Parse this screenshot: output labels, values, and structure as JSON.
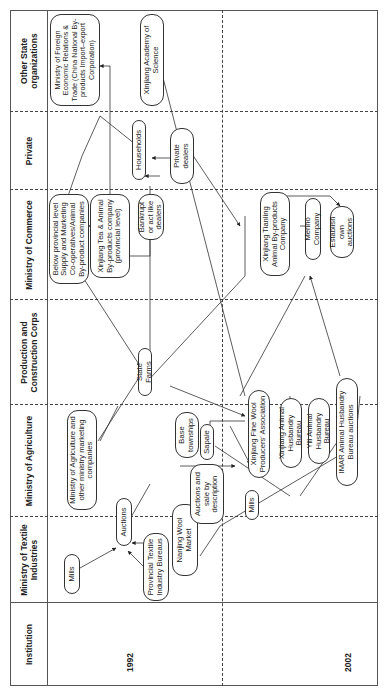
{
  "columns": [
    {
      "id": "institution",
      "label": "Institution"
    },
    {
      "id": "textile",
      "label": "Ministry of Textile Industries"
    },
    {
      "id": "agriculture",
      "label": "Ministry of Agriculture"
    },
    {
      "id": "pcc",
      "label": "Production and Construction Corps"
    },
    {
      "id": "commerce",
      "label": "Ministry of Commerce"
    },
    {
      "id": "private",
      "label": "Private"
    },
    {
      "id": "other",
      "label": "Other State organizations"
    }
  ],
  "years": {
    "y1992": "1992",
    "y2002": "2002"
  },
  "nodes": {
    "mills_1992": "Mills",
    "provincial_textile": "Provincial Textile Industry Bureaus",
    "auctions_1992": "Auctions",
    "nanjing_wool": "Nanjing Wool Market",
    "moa_marketing": "Ministry of Agriculture and other ministry marketing companies",
    "state_farms": "State Farms",
    "below_provincial": "Below provincial level Supply and Marketing Co-operatives/Animal By-product companies",
    "xinjiang_tea": "Xinjiang Tea & Animal By-products company (provincial level)",
    "bankrupt": "Bankrupt or act like dealers",
    "households": "Households",
    "private_dealers": "Private dealers",
    "mofert": "Ministry of Foreign Economic Relations & Trade (China National By-products Import–export Corporation)",
    "xj_academy": "Xinjiang Academy of Science",
    "base_townships": "Base townships",
    "sapale": "Sapale",
    "auctions_sale_desc": "Auctions and sale by description",
    "mills_2002": "Mills",
    "xj_fine_wool": "Xinjiang Fine Wool Producers' Association",
    "xj_animal_husbandry": "Xinjiang Animal Husbandry Bureau",
    "yili_bureau": "Yili Animal Husbandry Bureau",
    "imar_auctions": "IMAR Animal Husbandry Bureau auctions",
    "xj_tianling": "Xinjiang Tianling Animal By-products Company",
    "merino": "Merino Company",
    "establish_own": "Establish own auctions"
  }
}
